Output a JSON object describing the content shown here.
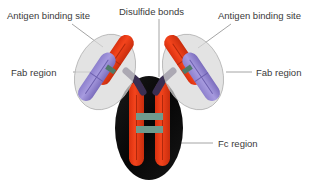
{
  "figure": {
    "background_color": "#ffffff"
  },
  "labels": {
    "antigen_binding_site_left": "Antigen binding site",
    "disulfide_bonds": "Disulfide bonds",
    "antigen_binding_site_right": "Antigen binding site",
    "fab_region_left": "Fab region",
    "fab_region_right": "Fab region",
    "fc_region": "Fc region"
  },
  "colors": {
    "heavy_chain": "#f03c17",
    "heavy_chain_shade": "#c42f10",
    "light_chain": "#9b8ed6",
    "light_chain_shade": "#7d6fc0",
    "fab_halo": "#d8d8d8",
    "fab_halo_stroke": "#b3b3b3",
    "fc_body": "#0d0d0d",
    "hinge": "#3a2f52",
    "disulfide": "#6f9a8d",
    "leader_line": "#9a9a9a",
    "text": "#3a3a3a"
  },
  "structure": {
    "fab_left": {
      "name": "Fab region left",
      "halo_center_x": 105,
      "halo_center_y": 72,
      "halo_rx": 29,
      "halo_ry": 39,
      "halo_rotation_deg": 22
    },
    "fab_right": {
      "name": "Fab region right",
      "halo_center_x": 193,
      "halo_center_y": 72,
      "halo_rx": 29,
      "halo_ry": 39,
      "halo_rotation_deg": -22
    },
    "fc": {
      "name": "Fc region",
      "center_x": 149,
      "center_y": 128,
      "rx": 34,
      "ry": 52
    },
    "disulfide_bond_count_fc": 2,
    "disulfide_bond_count_fab": 2
  }
}
